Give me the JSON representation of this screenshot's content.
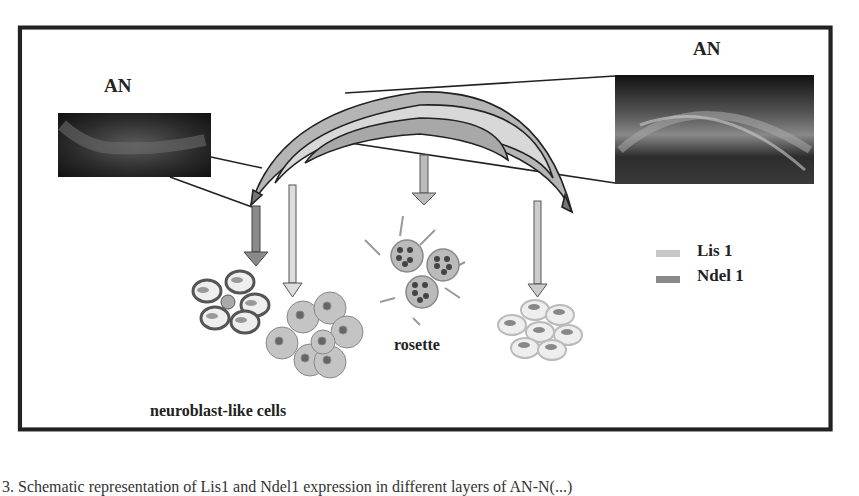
{
  "figure": {
    "labels": {
      "an_left": "AN",
      "an_right": "AN",
      "neuroblast": "neuroblast-like cells",
      "rosette": "rosette"
    },
    "legend": [
      {
        "label": "Lis 1",
        "color": "#c8c8c8"
      },
      {
        "label": "Ndel 1",
        "color": "#8a8a8a"
      }
    ],
    "caption": "3. Schematic representation of Lis1 and Ndel1 expression in different layers of AN-N(...)"
  }
}
